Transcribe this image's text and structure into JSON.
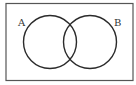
{
  "diagram": {
    "type": "venn",
    "universe": {
      "label": ""
    },
    "sets": [
      {
        "id": "A",
        "label": "A"
      },
      {
        "id": "B",
        "label": "B"
      }
    ],
    "colors": {
      "stroke": "#2b2b2b",
      "background": "#ffffff",
      "frame": "#555555"
    }
  }
}
